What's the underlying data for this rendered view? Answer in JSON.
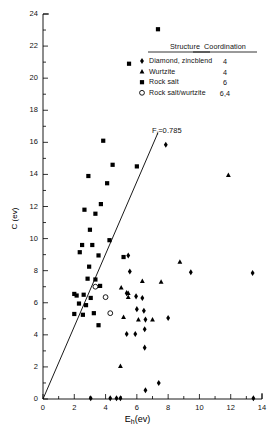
{
  "chart_data": {
    "type": "scatter",
    "title": "",
    "xlabel": "E_h(ev)",
    "xlabel_main": "E",
    "xlabel_sub": "h",
    "xlabel_unit": "(ev)",
    "ylabel": "C (ev)",
    "xlim": [
      0,
      14
    ],
    "ylim": [
      0,
      24
    ],
    "xticks": [
      0,
      2,
      4,
      6,
      8,
      10,
      12,
      14
    ],
    "xtick_labels": [
      "0",
      "2",
      "4",
      "6",
      "8",
      "10",
      "12",
      "14"
    ],
    "xminor_step": 1,
    "yticks": [
      0,
      2,
      4,
      6,
      8,
      10,
      12,
      14,
      16,
      18,
      20,
      22,
      24
    ],
    "ytick_labels": [
      "0",
      "2",
      "4",
      "6",
      "8",
      "10",
      "12",
      "14",
      "16",
      "18",
      "20",
      "22",
      "24"
    ],
    "yminor_step": 1,
    "grid": false,
    "legend_position": "top-right-inside",
    "annotations": [
      {
        "name": "ionicity-line-label",
        "text": "F",
        "sub": "i",
        "tail": "=0.785",
        "x": 7.0,
        "y": 17.2
      }
    ],
    "reference_line": {
      "name": "Fi=0.785 boundary",
      "label": "F_i=0.785",
      "from": {
        "x": 0.0,
        "y": 0.0
      },
      "to": {
        "x": 7.35,
        "y": 16.6
      },
      "slope": 2.26
    },
    "series": [
      {
        "name": "Diamond, zincblend",
        "marker": "diamond",
        "coordination": "4",
        "color": "#000000",
        "points": [
          {
            "x": 7.85,
            "y": 15.85
          },
          {
            "x": 5.45,
            "y": 8.95
          },
          {
            "x": 5.55,
            "y": 7.95
          },
          {
            "x": 9.45,
            "y": 7.9
          },
          {
            "x": 13.4,
            "y": 7.85
          },
          {
            "x": 5.35,
            "y": 6.6
          },
          {
            "x": 5.95,
            "y": 6.4
          },
          {
            "x": 6.35,
            "y": 6.3
          },
          {
            "x": 6.0,
            "y": 5.6
          },
          {
            "x": 6.45,
            "y": 5.5
          },
          {
            "x": 6.55,
            "y": 4.95
          },
          {
            "x": 8.0,
            "y": 5.05
          },
          {
            "x": 5.35,
            "y": 4.05
          },
          {
            "x": 5.9,
            "y": 4.05
          },
          {
            "x": 6.5,
            "y": 4.35
          },
          {
            "x": 6.5,
            "y": 3.2
          },
          {
            "x": 7.4,
            "y": 1.0
          },
          {
            "x": 6.55,
            "y": 0.55
          },
          {
            "x": 4.3,
            "y": 0.05
          },
          {
            "x": 4.7,
            "y": 0.05
          },
          {
            "x": 4.95,
            "y": 0.05
          },
          {
            "x": 3.05,
            "y": 0.05
          },
          {
            "x": 13.45,
            "y": 0.05
          }
        ]
      },
      {
        "name": "Wurtzite",
        "marker": "triangle",
        "coordination": "4",
        "color": "#000000",
        "points": [
          {
            "x": 11.85,
            "y": 13.95
          },
          {
            "x": 8.75,
            "y": 8.55
          },
          {
            "x": 6.35,
            "y": 7.35
          },
          {
            "x": 7.55,
            "y": 7.3
          },
          {
            "x": 5.0,
            "y": 6.95
          },
          {
            "x": 5.45,
            "y": 6.6
          },
          {
            "x": 5.45,
            "y": 6.35
          },
          {
            "x": 5.15,
            "y": 5.1
          },
          {
            "x": 6.1,
            "y": 4.95
          },
          {
            "x": 7.0,
            "y": 4.95
          },
          {
            "x": 4.95,
            "y": 2.05
          }
        ]
      },
      {
        "name": "Rock salt",
        "marker": "square",
        "coordination": "6",
        "color": "#000000",
        "points": [
          {
            "x": 7.35,
            "y": 23.05
          },
          {
            "x": 5.5,
            "y": 20.9
          },
          {
            "x": 3.85,
            "y": 16.1
          },
          {
            "x": 4.45,
            "y": 14.6
          },
          {
            "x": 6.0,
            "y": 14.5
          },
          {
            "x": 2.9,
            "y": 13.9
          },
          {
            "x": 4.1,
            "y": 13.45
          },
          {
            "x": 3.7,
            "y": 12.15
          },
          {
            "x": 2.65,
            "y": 11.8
          },
          {
            "x": 3.35,
            "y": 11.55
          },
          {
            "x": 3.0,
            "y": 10.55
          },
          {
            "x": 2.5,
            "y": 9.6
          },
          {
            "x": 3.15,
            "y": 9.6
          },
          {
            "x": 2.35,
            "y": 9.15
          },
          {
            "x": 3.55,
            "y": 8.95
          },
          {
            "x": 2.95,
            "y": 8.25
          },
          {
            "x": 5.15,
            "y": 8.85
          },
          {
            "x": 2.85,
            "y": 7.5
          },
          {
            "x": 3.35,
            "y": 7.45
          },
          {
            "x": 3.65,
            "y": 7.05
          },
          {
            "x": 2.0,
            "y": 6.55
          },
          {
            "x": 2.15,
            "y": 6.45
          },
          {
            "x": 2.6,
            "y": 6.5
          },
          {
            "x": 3.05,
            "y": 6.3
          },
          {
            "x": 2.3,
            "y": 5.95
          },
          {
            "x": 2.75,
            "y": 5.85
          },
          {
            "x": 2.0,
            "y": 5.3
          },
          {
            "x": 2.55,
            "y": 5.25
          },
          {
            "x": 3.25,
            "y": 5.35
          },
          {
            "x": 3.55,
            "y": 4.6
          },
          {
            "x": 4.25,
            "y": 9.9
          }
        ]
      },
      {
        "name": "Rock salt/wurtzite",
        "marker": "circle-open",
        "coordination": "6,4",
        "color": "#000000",
        "points": [
          {
            "x": 3.35,
            "y": 7.0
          },
          {
            "x": 4.0,
            "y": 6.35
          },
          {
            "x": 4.3,
            "y": 5.35
          }
        ]
      }
    ]
  },
  "legend": {
    "header_structure": "Structure",
    "header_coordination": "Coordination",
    "rows": [
      {
        "label": "Diamond, zincblend",
        "coordination": "4",
        "marker": "diamond"
      },
      {
        "label": "Wurtzite",
        "coordination": "4",
        "marker": "triangle"
      },
      {
        "label": "Rock salt",
        "coordination": "6",
        "marker": "square"
      },
      {
        "label": "Rock salt/wurtzite",
        "coordination": "6,4",
        "marker": "circle-open"
      }
    ]
  }
}
